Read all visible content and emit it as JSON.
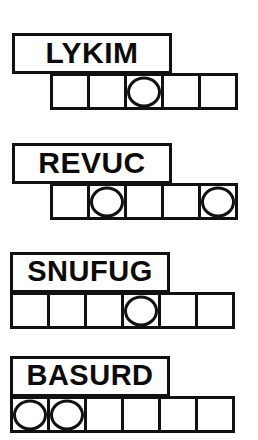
{
  "worksheet": {
    "title": "Word Unscramble Puzzle",
    "ink_color": "#111111",
    "paper_color": "#ffffff",
    "puzzles": [
      {
        "id": "puzzle-1",
        "word": "LYKIM",
        "tile_count": 5,
        "circled_tiles": [
          2
        ],
        "word_box": {
          "x": 12,
          "y": 33,
          "width": 160,
          "height": 41
        },
        "tile_row": {
          "x": 50,
          "y": 73,
          "tile_width": 40,
          "tile_height": 37
        },
        "font_size": 30
      },
      {
        "id": "puzzle-2",
        "word": "REVUC",
        "tile_count": 5,
        "circled_tiles": [
          1,
          4
        ],
        "word_box": {
          "x": 12,
          "y": 143,
          "width": 160,
          "height": 41
        },
        "tile_row": {
          "x": 50,
          "y": 183,
          "tile_width": 40,
          "tile_height": 37
        },
        "font_size": 30
      },
      {
        "id": "puzzle-3",
        "word": "SNUFUG",
        "tile_count": 6,
        "circled_tiles": [
          3
        ],
        "word_box": {
          "x": 10,
          "y": 252,
          "width": 160,
          "height": 41
        },
        "tile_row": {
          "x": 10,
          "y": 292,
          "tile_width": 40,
          "tile_height": 37
        },
        "font_size": 29
      },
      {
        "id": "puzzle-4",
        "word": "BASURD",
        "tile_count": 6,
        "circled_tiles": [
          0,
          1
        ],
        "word_box": {
          "x": 10,
          "y": 356,
          "width": 160,
          "height": 41
        },
        "tile_row": {
          "x": 10,
          "y": 396,
          "tile_width": 40,
          "tile_height": 37
        },
        "font_size": 29
      }
    ]
  }
}
